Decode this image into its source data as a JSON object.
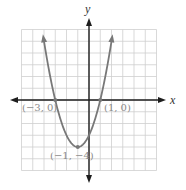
{
  "chart_data": {
    "type": "line",
    "title": "",
    "function": "y = x^2 + 2x - 3",
    "xlabel": "x",
    "ylabel": "y",
    "xlim": [
      -6,
      6
    ],
    "ylim": [
      -6,
      6
    ],
    "grid": true,
    "grid_step": 1,
    "series": [
      {
        "name": "parabola",
        "x": [
          -4.16,
          -4,
          -3,
          -2,
          -1,
          0,
          1,
          2,
          2.16
        ],
        "y": [
          6,
          5,
          0,
          -3,
          -4,
          -3,
          0,
          5,
          6
        ],
        "arrows_at_ends": true
      }
    ],
    "annotations": [
      {
        "text": "(−3, 0)",
        "x": -3,
        "y": 0,
        "kind": "x-intercept"
      },
      {
        "text": "(1, 0)",
        "x": 1,
        "y": 0,
        "kind": "x-intercept"
      },
      {
        "text": "(−1, −4)",
        "x": -1,
        "y": -4,
        "kind": "vertex"
      }
    ]
  },
  "labels": {
    "x_axis": "x",
    "y_axis": "y",
    "point_left": "(−3, 0)",
    "point_right": "(1, 0)",
    "point_vertex": "(−1, −4)"
  },
  "colors": {
    "grid": "#cfcfcf",
    "axis": "#1e1e1e",
    "curve": "#787878",
    "label": "#8a8a8a"
  }
}
